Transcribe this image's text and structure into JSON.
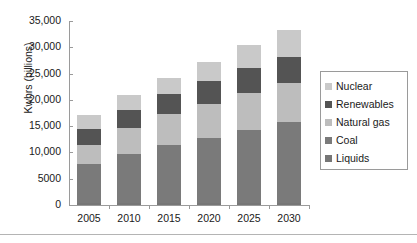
{
  "chart_data": {
    "type": "bar",
    "stacked": true,
    "title": "",
    "xlabel": "",
    "ylabel": "Kwhrs (billions)",
    "categories": [
      "2005",
      "2010",
      "2015",
      "2020",
      "2025",
      "2030"
    ],
    "ylim": [
      0,
      35000
    ],
    "yticks": [
      0,
      5000,
      10000,
      15000,
      20000,
      25000,
      30000,
      35000
    ],
    "ytick_labels": [
      "0",
      "5000",
      "10,000",
      "15,000",
      "20,000",
      "25,000",
      "30,000",
      "35,000"
    ],
    "grid": false,
    "legend_position": "right",
    "series": [
      {
        "name": "Liquids",
        "color": "#767676",
        "values": [
          300,
          350,
          380,
          400,
          420,
          450
        ]
      },
      {
        "name": "Coal",
        "color": "#7a7a7a",
        "values": [
          7500,
          9400,
          11100,
          12400,
          13900,
          15300
        ]
      },
      {
        "name": "Natural gas",
        "color": "#bdbdbd",
        "values": [
          3700,
          4900,
          5800,
          6500,
          7000,
          7400
        ]
      },
      {
        "name": "Renewables",
        "color": "#545454",
        "values": [
          3000,
          3500,
          3900,
          4300,
          4700,
          5000
        ]
      },
      {
        "name": "Nuclear",
        "color": "#c9c9c9",
        "values": [
          2700,
          2700,
          2900,
          3700,
          4400,
          5200
        ]
      }
    ],
    "totals": [
      17200,
      20850,
      24080,
      27300,
      30420,
      33350
    ]
  },
  "legend": {
    "items": [
      {
        "label": "Nuclear",
        "color": "#c9c9c9"
      },
      {
        "label": "Renewables",
        "color": "#545454"
      },
      {
        "label": "Natural gas",
        "color": "#bdbdbd"
      },
      {
        "label": "Coal",
        "color": "#7a7a7a"
      },
      {
        "label": "Liquids",
        "color": "#767676"
      }
    ]
  },
  "axis": {
    "y_title": "Kwhrs (billions)"
  }
}
